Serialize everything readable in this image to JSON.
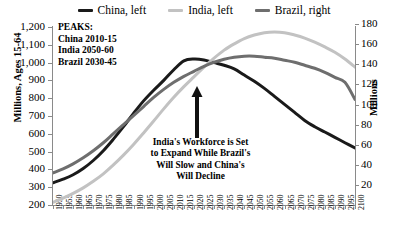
{
  "chart_data": {
    "type": "line",
    "title": "",
    "xlabel": "",
    "ylabel": "Millions, Ages 15-64",
    "ylabel_right": "Millions",
    "xlim": [
      1950,
      2100
    ],
    "ylim": [
      200,
      1200
    ],
    "ylim_right": [
      0,
      180
    ],
    "grid": false,
    "legend_position": "top",
    "x": [
      1950,
      1955,
      1960,
      1965,
      1970,
      1975,
      1980,
      1985,
      1990,
      1995,
      2000,
      2005,
      2010,
      2015,
      2020,
      2025,
      2030,
      2035,
      2040,
      2045,
      2050,
      2055,
      2060,
      2065,
      2070,
      2075,
      2080,
      2085,
      2090,
      2095,
      2100
    ],
    "xtick_labels": [
      "1950",
      "1955",
      "1960",
      "1965",
      "1970",
      "1975",
      "1980",
      "1985",
      "1990",
      "1995",
      "2000",
      "2005",
      "2010",
      "2015",
      "2020",
      "2025",
      "2030",
      "2035",
      "2040",
      "2045",
      "2050",
      "2055",
      "2060",
      "2065",
      "2070",
      "2075",
      "2080",
      "2085",
      "2090",
      "2095",
      "2100"
    ],
    "ytick_labels_left": [
      "1,200",
      "1,100",
      "1,000",
      "900",
      "800",
      "700",
      "600",
      "500",
      "400",
      "300",
      "200"
    ],
    "ytick_values_left": [
      1200,
      1100,
      1000,
      900,
      800,
      700,
      600,
      500,
      400,
      300,
      200
    ],
    "ytick_labels_right": [
      "180",
      "160",
      "140",
      "120",
      "100",
      "80",
      "60",
      "40",
      "20"
    ],
    "ytick_values_right": [
      180,
      160,
      140,
      120,
      100,
      80,
      60,
      40,
      20
    ],
    "series": [
      {
        "name": "China, left",
        "legend_label": "China, left",
        "axis": "left",
        "color": "#1a1a1a",
        "values": [
          325,
          345,
          370,
          405,
          450,
          505,
          570,
          640,
          715,
          785,
          845,
          900,
          960,
          1010,
          1020,
          1015,
          1000,
          985,
          965,
          930,
          895,
          855,
          810,
          765,
          720,
          675,
          640,
          610,
          580,
          550,
          520
        ]
      },
      {
        "name": "India, left",
        "legend_label": "India, left",
        "axis": "left",
        "color": "#c2c2c2",
        "values": [
          215,
          238,
          265,
          296,
          333,
          375,
          425,
          480,
          540,
          605,
          672,
          740,
          805,
          865,
          920,
          975,
          1025,
          1070,
          1105,
          1135,
          1155,
          1168,
          1172,
          1168,
          1155,
          1138,
          1115,
          1088,
          1058,
          1020,
          975
        ]
      },
      {
        "name": "Brazil, right",
        "legend_label": "Brazil, right",
        "axis": "right",
        "color": "#6e6e6e",
        "values": [
          32,
          36,
          41,
          47,
          54,
          62,
          71,
          80,
          89,
          98,
          107,
          115,
          122,
          128,
          133,
          138,
          142,
          145,
          147,
          148,
          148,
          147,
          146,
          144,
          142,
          139,
          136,
          132,
          127,
          122,
          105
        ]
      }
    ],
    "annotations": [
      {
        "name": "peaks-note",
        "lines": [
          "PEAKS:",
          "China 2010-15",
          "India 2050-60",
          "Brazil 2030-45"
        ]
      },
      {
        "name": "workforce-note",
        "lines": [
          "India's Workforce is Set",
          "to Expand While Brazil's",
          "Will Slow and China's",
          "Will Decline"
        ]
      }
    ],
    "arrow": {
      "name": "up-arrow",
      "direction": "up",
      "x_year": 2021,
      "from_value": 565,
      "to_value": 810
    }
  }
}
